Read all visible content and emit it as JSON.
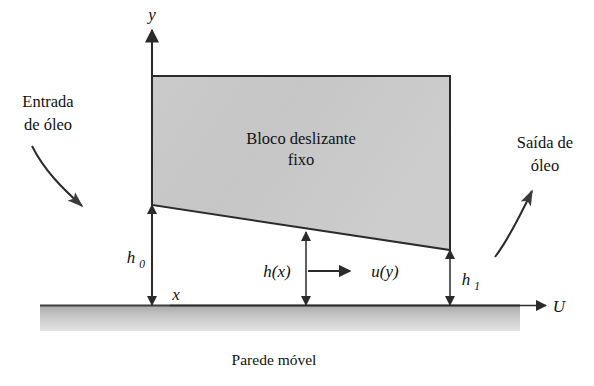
{
  "figure": {
    "block_label_line1": "Bloco deslizante",
    "block_label_line2": "fixo",
    "inlet_label_line1": "Entrada",
    "inlet_label_line2": "de óleo",
    "outlet_label_line1": "Saída de",
    "outlet_label_line2": "óleo",
    "wall_caption": "Parede móvel",
    "axis_y": "y",
    "axis_x": "x",
    "velocity_wall": "U",
    "gap_inlet_base": "h",
    "gap_inlet_sub": "0",
    "gap_outlet_base": "h",
    "gap_outlet_sub": "1",
    "gap_variable": "h(x)",
    "velocity_profile": "u(y)"
  },
  "colors": {
    "block_fill": "#c9c9c9",
    "block_stroke": "#2b2b2b",
    "wall_top": "#4a4a4a",
    "wall_fill": "#bdbdbd",
    "text": "#111111",
    "background": "#ffffff"
  }
}
